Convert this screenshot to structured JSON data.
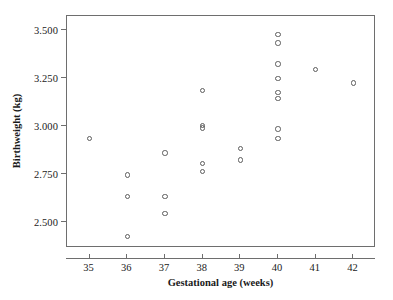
{
  "chart_data": {
    "type": "scatter",
    "title": "",
    "xlabel": "Gestational age (weeks)",
    "ylabel": "Birthweight (kg)",
    "xlim": [
      34.4,
      42.6
    ],
    "ylim": [
      2.36,
      3.57
    ],
    "grid": false,
    "legend": null,
    "marker": "open-circle",
    "xticks": [
      35,
      36,
      37,
      38,
      39,
      40,
      41,
      42
    ],
    "xtick_labels": [
      "35",
      "36",
      "37",
      "38",
      "39",
      "40",
      "41",
      "42"
    ],
    "yticks": [
      2.5,
      2.75,
      3.0,
      3.25,
      3.5
    ],
    "ytick_labels": [
      "2.500",
      "2.750",
      "3.000",
      "3.250",
      "3.500"
    ],
    "points": [
      {
        "x": 35,
        "y": 2.93
      },
      {
        "x": 36,
        "y": 2.74
      },
      {
        "x": 36,
        "y": 2.63
      },
      {
        "x": 36,
        "y": 2.42
      },
      {
        "x": 37,
        "y": 2.855
      },
      {
        "x": 37,
        "y": 2.63
      },
      {
        "x": 37,
        "y": 2.54
      },
      {
        "x": 38,
        "y": 3.18
      },
      {
        "x": 38,
        "y": 3.0
      },
      {
        "x": 38,
        "y": 2.985
      },
      {
        "x": 38,
        "y": 2.8
      },
      {
        "x": 38,
        "y": 2.76
      },
      {
        "x": 39,
        "y": 2.88
      },
      {
        "x": 39,
        "y": 2.82
      },
      {
        "x": 40,
        "y": 3.475
      },
      {
        "x": 40,
        "y": 3.43
      },
      {
        "x": 40,
        "y": 3.32
      },
      {
        "x": 40,
        "y": 3.245
      },
      {
        "x": 40,
        "y": 3.17
      },
      {
        "x": 40,
        "y": 3.14
      },
      {
        "x": 40,
        "y": 2.98
      },
      {
        "x": 40,
        "y": 2.93
      },
      {
        "x": 41,
        "y": 3.29
      },
      {
        "x": 42,
        "y": 3.22
      }
    ]
  },
  "colors": {
    "axis": "#6e6e6e",
    "marker_stroke": "#5c5c5c",
    "text": "#1a1a1a",
    "background": "#ffffff"
  }
}
